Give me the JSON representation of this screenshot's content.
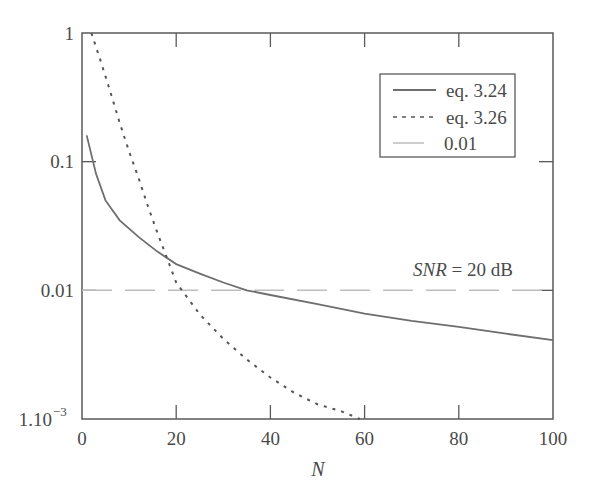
{
  "chart_data": {
    "type": "line",
    "title": "",
    "xlabel": "N",
    "ylabel": "",
    "xlim": [
      0,
      100
    ],
    "ylim": [
      0.001,
      1
    ],
    "yscale": "log",
    "grid": false,
    "legend_position": "upper right (inside)",
    "x_ticks": [
      "0",
      "20",
      "40",
      "60",
      "80",
      "100"
    ],
    "y_ticks": [
      "1",
      "0.1",
      "0.01",
      "1.10-3"
    ],
    "annotations": [
      {
        "text_italic": "SNR",
        "text_rest": " = 20 dB",
        "x": 88,
        "y": 0.012
      }
    ],
    "series": [
      {
        "name": "eq. 3.24",
        "style": "solid",
        "color": "#6e6e6e",
        "x": [
          1,
          3,
          5,
          8,
          12,
          16,
          20,
          25,
          30,
          35,
          40,
          50,
          60,
          70,
          80,
          90,
          100
        ],
        "values": [
          0.16,
          0.08,
          0.05,
          0.035,
          0.026,
          0.02,
          0.016,
          0.0135,
          0.0115,
          0.01,
          0.0092,
          0.0078,
          0.0066,
          0.0058,
          0.0052,
          0.0046,
          0.0041
        ]
      },
      {
        "name": "eq. 3.26",
        "style": "dotted",
        "color": "#555555",
        "x": [
          2,
          4,
          6,
          8,
          10,
          12,
          14,
          16,
          18,
          20,
          25,
          30,
          35,
          40,
          45,
          50,
          55,
          59
        ],
        "values": [
          1.0,
          0.6,
          0.35,
          0.2,
          0.12,
          0.075,
          0.045,
          0.028,
          0.018,
          0.0115,
          0.0065,
          0.0042,
          0.0029,
          0.0021,
          0.0016,
          0.0013,
          0.00115,
          0.001
        ]
      },
      {
        "name": "0.01",
        "style": "dashed",
        "color": "#bdbdbd",
        "x": [
          0,
          100
        ],
        "values": [
          0.01,
          0.01
        ]
      }
    ]
  },
  "legend": {
    "items": [
      {
        "label": "eq. 3.24"
      },
      {
        "label": "eq. 3.26"
      },
      {
        "label": "0.01"
      }
    ]
  },
  "axes": {
    "x_label": "N",
    "x_ticks": [
      "0",
      "20",
      "40",
      "60",
      "80",
      "100"
    ],
    "y_ticks": [
      "1",
      "0.1",
      "0.01"
    ],
    "y_tick_min_mantissa": "1.10",
    "y_tick_min_exp": "−3"
  },
  "annotation": {
    "italic": "SNR",
    "rest": " = 20 dB"
  }
}
